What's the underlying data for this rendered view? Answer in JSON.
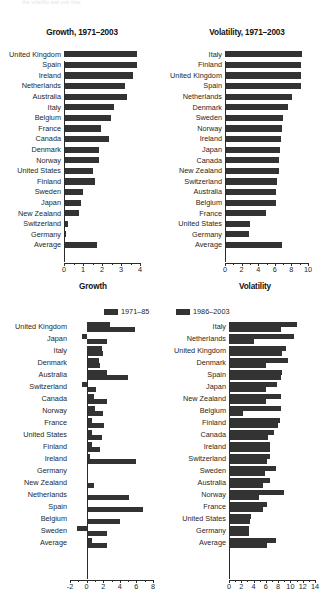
{
  "figure": {
    "caption": "this volatility and over time."
  },
  "legend": {
    "items": [
      {
        "label": "1971–85",
        "color": "#333333"
      },
      {
        "label": "1986–2003",
        "color": "#333333"
      }
    ]
  },
  "chart_data": [
    {
      "id": "growth-1971-2003",
      "type": "bar",
      "orientation": "horizontal",
      "title": "Growth, 1971–2003",
      "xlabel": "",
      "ylabel": "",
      "xlim": [
        0,
        4
      ],
      "xticks": [
        0,
        1,
        2,
        3,
        4
      ],
      "xtick_labels": [
        "0",
        "1",
        "2",
        "3",
        "4"
      ],
      "grid": false,
      "legend_position": "none",
      "bar_color": "#333333",
      "categories": [
        "United Kingdom",
        "Spain",
        "Ireland",
        "Netherlands",
        "Australia",
        "Italy",
        "Belgium",
        "France",
        "Canada",
        "Denmark",
        "Norway",
        "United States",
        "Finland",
        "Sweden",
        "Japan",
        "New Zealand",
        "Switzerland",
        "Germany",
        "Average"
      ],
      "values": [
        3.85,
        3.82,
        3.62,
        3.23,
        3.3,
        2.65,
        2.45,
        1.95,
        2.35,
        1.85,
        1.82,
        1.55,
        1.65,
        0.98,
        0.9,
        0.8,
        0.2,
        0.13,
        1.75
      ]
    },
    {
      "id": "volatility-1971-2003",
      "type": "bar",
      "orientation": "horizontal",
      "title": "Volatility, 1971–2003",
      "xlabel": "",
      "ylabel": "",
      "xlim": [
        0,
        10
      ],
      "xticks": [
        0,
        2,
        4,
        6,
        8,
        10
      ],
      "xtick_labels": [
        "0",
        "2",
        "4",
        "6",
        "8",
        "10"
      ],
      "grid": false,
      "legend_position": "none",
      "bar_color": "#333333",
      "categories": [
        "Italy",
        "Finland",
        "United Kingdom",
        "Spain",
        "Netherlands",
        "Denmark",
        "Sweden",
        "Norway",
        "Ireland",
        "Japan",
        "Canada",
        "New Zealand",
        "Switzerland",
        "Australia",
        "Belgium",
        "France",
        "United States",
        "Germany",
        "Average"
      ],
      "values": [
        9.3,
        9.2,
        9.2,
        9.1,
        8.1,
        7.6,
        7.0,
        6.9,
        6.8,
        6.6,
        6.5,
        6.5,
        6.3,
        6.2,
        6.1,
        4.9,
        3.0,
        2.9,
        6.9
      ]
    },
    {
      "id": "growth-two-periods",
      "type": "bar",
      "orientation": "horizontal",
      "title": "Growth",
      "xlabel": "",
      "ylabel": "",
      "xlim": [
        -2,
        8
      ],
      "xticks": [
        -2,
        0,
        2,
        4,
        6,
        8
      ],
      "xtick_labels": [
        "-2",
        "0",
        "2",
        "4",
        "6",
        "8"
      ],
      "grid": false,
      "legend_position": "top",
      "categories": [
        "United Kingdom",
        "Japan",
        "Italy",
        "Denmark",
        "Australia",
        "Switzerland",
        "Canada",
        "Norway",
        "France",
        "United States",
        "Finland",
        "Ireland",
        "Germany",
        "New Zealand",
        "Netherlands",
        "Spain",
        "Belgium",
        "Sweden",
        "Average"
      ],
      "series": [
        {
          "name": "1971–85",
          "color": "#333333",
          "values": [
            2.8,
            -0.5,
            1.9,
            1.5,
            2.4,
            -0.6,
            0.9,
            1.0,
            0.7,
            0.6,
            0.6,
            0.4,
            0.1,
            0.0,
            0.1,
            0.15,
            0.1,
            -1.2,
            0.7
          ]
        },
        {
          "name": "1986–2003",
          "color": "#333333",
          "values": [
            5.8,
            2.4,
            2.0,
            1.6,
            5.0,
            1.1,
            2.5,
            2.0,
            2.1,
            1.8,
            1.6,
            5.9,
            0.05,
            0.9,
            5.1,
            6.8,
            4.0,
            2.5,
            2.5
          ]
        }
      ]
    },
    {
      "id": "volatility-two-periods",
      "type": "bar",
      "orientation": "horizontal",
      "title": "Volatility",
      "xlabel": "",
      "ylabel": "",
      "xlim": [
        0,
        14
      ],
      "xticks": [
        0,
        2,
        4,
        6,
        8,
        10,
        12,
        14
      ],
      "xtick_labels": [
        "0",
        "2",
        "4",
        "6",
        "8",
        "10",
        "12",
        "14"
      ],
      "grid": false,
      "legend_position": "top",
      "categories": [
        "Italy",
        "Netherlands",
        "United Kingdom",
        "Denmark",
        "Spain",
        "Japan",
        "New Zealand",
        "Belgium",
        "Finland",
        "Canada",
        "Ireland",
        "Switzerland",
        "Sweden",
        "Australia",
        "Norway",
        "France",
        "United States",
        "Germany",
        "Average"
      ],
      "series": [
        {
          "name": "1971–85",
          "color": "#333333",
          "values": [
            11.0,
            10.6,
            9.2,
            9.6,
            8.6,
            7.8,
            8.4,
            8.4,
            8.3,
            7.4,
            6.6,
            6.7,
            7.7,
            6.7,
            8.9,
            6.2,
            3.6,
            3.2,
            7.7
          ]
        },
        {
          "name": "1986–2003",
          "color": "#333333",
          "values": [
            8.5,
            4.0,
            8.7,
            6.0,
            8.4,
            6.1,
            6.0,
            2.3,
            8.0,
            6.3,
            6.6,
            6.2,
            5.9,
            5.6,
            4.9,
            5.5,
            3.4,
            3.3,
            6.2
          ]
        }
      ]
    }
  ]
}
